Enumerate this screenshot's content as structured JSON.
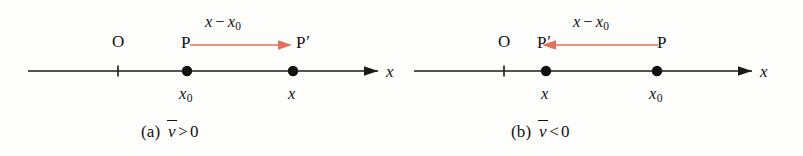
{
  "figure": {
    "background_color": "#fdfdfb",
    "ink_color": "#1a1a1a",
    "accent_color": "#e2705c",
    "panels": [
      {
        "id": "a",
        "caption_tag": "(a)",
        "caption_expr_var": "v",
        "caption_expr_rel": ">",
        "caption_expr_value": "0",
        "axis_variable": "x",
        "origin_label": "O",
        "displacement_label_lead": "x",
        "displacement_label_op": "−",
        "displacement_label_trail": "x",
        "displacement_label_trail_sub": "0",
        "arrow_direction": "right",
        "points": [
          {
            "name": "P",
            "marker_label": "P",
            "prime": "",
            "value_label": "x",
            "value_sub": "0"
          },
          {
            "name": "P-prime",
            "marker_label": "P",
            "prime": "′",
            "value_label": "x",
            "value_sub": ""
          }
        ]
      },
      {
        "id": "b",
        "caption_tag": "(b)",
        "caption_expr_var": "v",
        "caption_expr_rel": "<",
        "caption_expr_value": "0",
        "axis_variable": "x",
        "origin_label": "O",
        "displacement_label_lead": "x",
        "displacement_label_op": "−",
        "displacement_label_trail": "x",
        "displacement_label_trail_sub": "0",
        "arrow_direction": "left",
        "points": [
          {
            "name": "P-prime",
            "marker_label": "P",
            "prime": "′",
            "value_label": "x",
            "value_sub": ""
          },
          {
            "name": "P",
            "marker_label": "P",
            "prime": "",
            "value_label": "x",
            "value_sub": "0"
          }
        ]
      }
    ]
  }
}
